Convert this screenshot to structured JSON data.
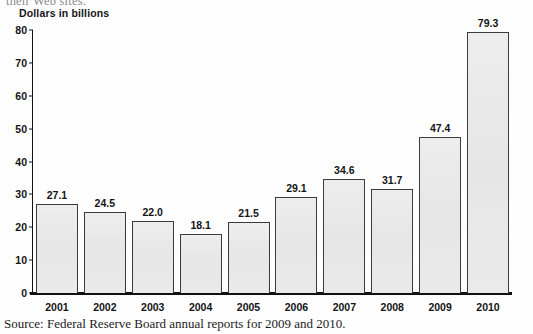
{
  "page": {
    "cutoff_text": "their Web sites.",
    "source_note": "Source: Federal Reserve Board annual reports for 2009 and 2010."
  },
  "chart_data": {
    "type": "bar",
    "title": "",
    "subtitle": "",
    "xlabel": "",
    "ylabel": "Dollars in billions",
    "categories": [
      "2001",
      "2002",
      "2003",
      "2004",
      "2005",
      "2006",
      "2007",
      "2008",
      "2009",
      "2010"
    ],
    "values": [
      27.1,
      24.5,
      22.0,
      18.1,
      21.5,
      29.1,
      34.6,
      31.7,
      47.4,
      79.3
    ],
    "value_labels": [
      "27.1",
      "24.5",
      "22.0",
      "18.1",
      "21.5",
      "29.1",
      "34.6",
      "31.7",
      "47.4",
      "79.3"
    ],
    "ylim": [
      0,
      80
    ],
    "yticks": [
      0,
      10,
      20,
      30,
      40,
      50,
      60,
      70,
      80
    ],
    "ytick_labels": [
      "0",
      "10",
      "20",
      "30",
      "40",
      "50",
      "60",
      "70",
      "80"
    ],
    "grid": false,
    "legend": "none",
    "bar_fill_color": "#e9e9e9",
    "bar_edge_color": "#3b3b3b",
    "axis_color": "#111111",
    "text_color": "#141414"
  }
}
